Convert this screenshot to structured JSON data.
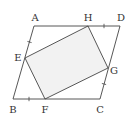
{
  "diagram": {
    "type": "geometry",
    "colors": {
      "stroke": "#444444",
      "fill": "#f2f2f2",
      "label": "#333333",
      "background": "#ffffff"
    },
    "points": {
      "A": {
        "x": 34,
        "y": 26,
        "label": "A",
        "lx": 35,
        "ly": 21
      },
      "D": {
        "x": 120,
        "y": 26,
        "label": "D",
        "lx": 121,
        "ly": 21
      },
      "B": {
        "x": 13,
        "y": 99,
        "label": "B",
        "lx": 13,
        "ly": 113
      },
      "C": {
        "x": 100,
        "y": 99,
        "label": "C",
        "lx": 100,
        "ly": 113
      },
      "H": {
        "x": 88,
        "y": 26,
        "label": "H",
        "lx": 88,
        "ly": 21
      },
      "E": {
        "x": 25,
        "y": 58,
        "label": "E",
        "lx": 18,
        "ly": 61
      },
      "F": {
        "x": 45,
        "y": 99,
        "label": "F",
        "lx": 45,
        "ly": 113
      },
      "G": {
        "x": 108,
        "y": 68,
        "label": "G",
        "lx": 114,
        "ly": 74
      }
    },
    "outer_shape": [
      "A",
      "D",
      "C",
      "B"
    ],
    "inner_shape": [
      "E",
      "H",
      "G",
      "F"
    ],
    "equal_segments": [
      "AE",
      "HD",
      "BF",
      "GC"
    ],
    "tick_marks": [
      {
        "segment": "AE",
        "x": 29.5,
        "y": 42
      },
      {
        "segment": "HD",
        "x": 104,
        "y": 26
      },
      {
        "segment": "BF",
        "x": 29,
        "y": 99
      },
      {
        "segment": "GC",
        "x": 104,
        "y": 84
      }
    ]
  }
}
